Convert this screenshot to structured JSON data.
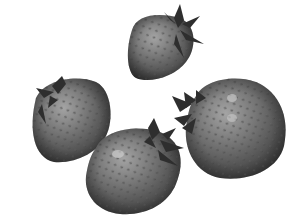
{
  "scene": {
    "description": "Grayscale image of four strawberries on a white background",
    "background": "#ffffff",
    "palette": {
      "light": "#9a9a9a",
      "mid": "#6a6a6a",
      "dark": "#3a3a3a",
      "leaf": "#2e2e2e",
      "seed": "#4a4a4a",
      "highlight": "#d8d8d8"
    },
    "objects": [
      {
        "name": "strawberry-top",
        "cx": 160,
        "cy": 45,
        "rx": 34,
        "ry": 35
      },
      {
        "name": "strawberry-left",
        "cx": 70,
        "cy": 120,
        "rx": 41,
        "ry": 44
      },
      {
        "name": "strawberry-bottom",
        "cx": 133,
        "cy": 172,
        "rx": 50,
        "ry": 46
      },
      {
        "name": "strawberry-right",
        "cx": 237,
        "cy": 128,
        "rx": 50,
        "ry": 52
      }
    ]
  }
}
